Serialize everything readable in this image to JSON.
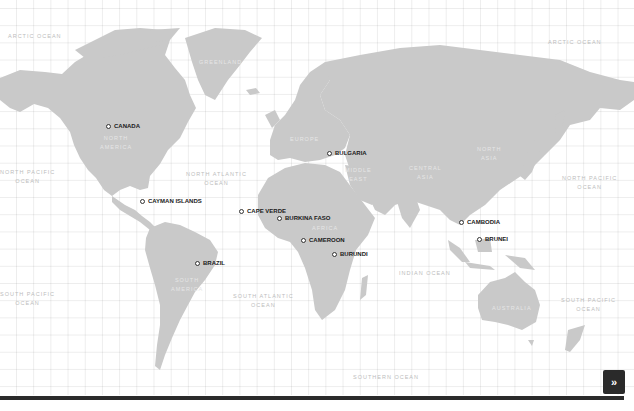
{
  "map": {
    "title": "World map",
    "colors": {
      "land": "#c9c9c9",
      "background": "#ffffff",
      "grid": "#ededed",
      "marker_text": "#1a1a1a",
      "bottom_bar": "#2b2b2b",
      "next_button": "#2a2a2a"
    },
    "markers": [
      {
        "label": "CANADA",
        "x": 108,
        "y": 126
      },
      {
        "label": "CAYMAN ISLANDS",
        "x": 142,
        "y": 201
      },
      {
        "label": "BULGARIA",
        "x": 329,
        "y": 153
      },
      {
        "label": "CAPE VERDE",
        "x": 241,
        "y": 211
      },
      {
        "label": "BURKINA FASO",
        "x": 279,
        "y": 218
      },
      {
        "label": "CAMEROON",
        "x": 303,
        "y": 240
      },
      {
        "label": "BURUNDI",
        "x": 334,
        "y": 254
      },
      {
        "label": "BRAZIL",
        "x": 197,
        "y": 263
      },
      {
        "label": "CAMBODIA",
        "x": 461,
        "y": 222
      },
      {
        "label": "BRUNEI",
        "x": 479,
        "y": 239
      }
    ],
    "ocean_labels": [
      {
        "text": "ARCTIC OCEAN",
        "x": 8,
        "y": 32
      },
      {
        "text": "ARCTIC OCEAN",
        "x": 548,
        "y": 38
      },
      {
        "text": "NORTH PACIFIC\nOCEAN",
        "x": 0,
        "y": 168
      },
      {
        "text": "NORTH ATLANTIC\nOCEAN",
        "x": 186,
        "y": 170
      },
      {
        "text": "NORTH PACIFIC\nOCEAN",
        "x": 562,
        "y": 174
      },
      {
        "text": "SOUTH PACIFIC\nOCEAN",
        "x": 0,
        "y": 290
      },
      {
        "text": "SOUTH ATLANTIC\nOCEAN",
        "x": 233,
        "y": 292
      },
      {
        "text": "INDIAN OCEAN",
        "x": 399,
        "y": 269
      },
      {
        "text": "SOUTH PACIFIC\nOCEAN",
        "x": 561,
        "y": 296
      },
      {
        "text": "SOUTHERN OCEAN",
        "x": 353,
        "y": 373
      }
    ],
    "region_labels": [
      {
        "text": "GREENLAND",
        "x": 199,
        "y": 58
      },
      {
        "text": "NORTH\nAMERICA",
        "x": 100,
        "y": 134
      },
      {
        "text": "EUROPE",
        "x": 290,
        "y": 135
      },
      {
        "text": "MIDDLE\nEAST",
        "x": 345,
        "y": 166
      },
      {
        "text": "CENTRAL\nASIA",
        "x": 409,
        "y": 164
      },
      {
        "text": "NORTH\nASIA",
        "x": 477,
        "y": 145
      },
      {
        "text": "AFRICA",
        "x": 312,
        "y": 224
      },
      {
        "text": "SOUTH\nAMERICA",
        "x": 171,
        "y": 276
      },
      {
        "text": "AUSTRALIA",
        "x": 492,
        "y": 304
      }
    ],
    "next_button": {
      "label": "»"
    }
  }
}
